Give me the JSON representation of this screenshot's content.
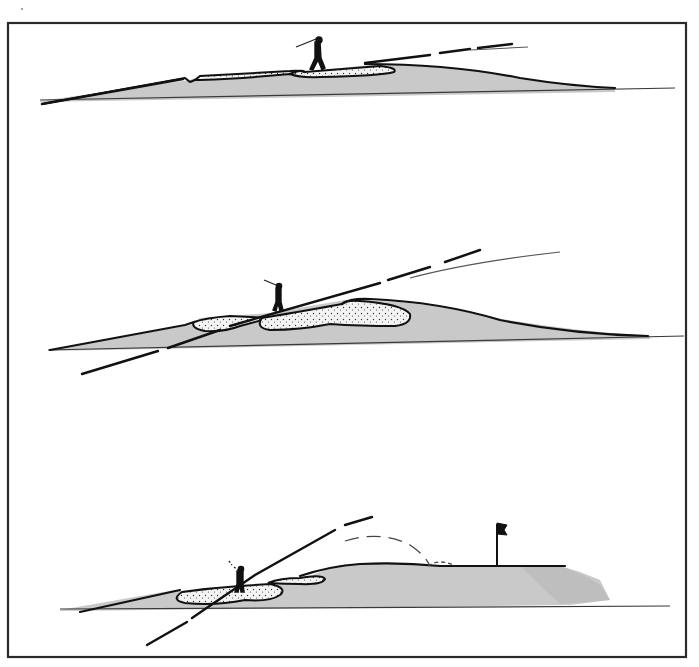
{
  "illustration": {
    "subject": "golf bunker cross-section diagrams",
    "panels": [
      {
        "id": "top",
        "description": "Shallow bunker, golfer on sand with low trajectory line",
        "elements": [
          "golfer-icon",
          "bunker-sand",
          "turf-mound",
          "aim-line",
          "ball-trajectory"
        ]
      },
      {
        "id": "middle",
        "description": "Two bunkers on rising slope, golfer between them, steeper aim line",
        "elements": [
          "golfer-icon",
          "bunker-sand-left",
          "bunker-sand-right",
          "turf-mound",
          "aim-line",
          "ball-trajectory"
        ]
      },
      {
        "id": "bottom",
        "description": "Bunkers before green, steep aim line, dashed ball flight landing near flag",
        "elements": [
          "golfer-icon",
          "bunker-sand-left",
          "bunker-sand-right",
          "turf-mound",
          "aim-line",
          "ball-flight-dashed",
          "flagstick-icon"
        ]
      }
    ],
    "colors": {
      "frame": "#2a2a2a",
      "ink": "#111111",
      "turf": "#c9c9c9",
      "sand": "#f2f2f2",
      "background": "#ffffff"
    }
  }
}
